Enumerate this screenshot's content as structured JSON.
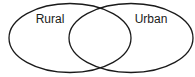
{
  "diagram": {
    "type": "venn",
    "sets": [
      {
        "label": "Rural",
        "cx": 70,
        "cy": 38,
        "rx": 61,
        "ry": 34.5,
        "label_x": 50,
        "label_y": 23
      },
      {
        "label": "Urban",
        "cx": 131,
        "cy": 38,
        "rx": 62,
        "ry": 34.5,
        "label_x": 151,
        "label_y": 23
      }
    ],
    "stroke_color": "#1a1a1a",
    "background": "#ffffff"
  }
}
